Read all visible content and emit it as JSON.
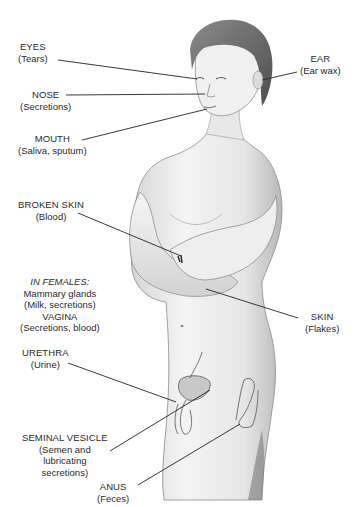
{
  "diagram": {
    "labels": [
      {
        "id": "eyes",
        "title": "EYES",
        "sub": "(Tears)"
      },
      {
        "id": "ear",
        "title": "EAR",
        "sub": "(Ear wax)"
      },
      {
        "id": "nose",
        "title": "NOSE",
        "sub": "(Secretions)"
      },
      {
        "id": "mouth",
        "title": "MOUTH",
        "sub": "(Saliva, sputum)"
      },
      {
        "id": "broken-skin",
        "title": "BROKEN SKIN",
        "sub": "(Blood)"
      },
      {
        "id": "in-females",
        "heading": "IN FEMALES:",
        "lines": [
          "Mammary glands",
          "(Milk, secretions)",
          "VAGINA",
          "(Secretions, blood)"
        ]
      },
      {
        "id": "skin",
        "title": "SKIN",
        "sub": "(Flakes)"
      },
      {
        "id": "urethra",
        "title": "URETHRA",
        "sub": "(Urine)"
      },
      {
        "id": "seminal-vesicle",
        "title": "SEMINAL VESICLE",
        "sub_lines": [
          "(Semen and",
          "lubricating",
          "secretions)"
        ]
      },
      {
        "id": "anus",
        "title": "ANUS",
        "sub": "(Feces)"
      }
    ],
    "colors": {
      "line": "#222222",
      "skin_light": "#f2f2f2",
      "skin_shade": "#bdbdbd",
      "hair": "#6a6a6a",
      "text": "#2a2a2a"
    }
  }
}
